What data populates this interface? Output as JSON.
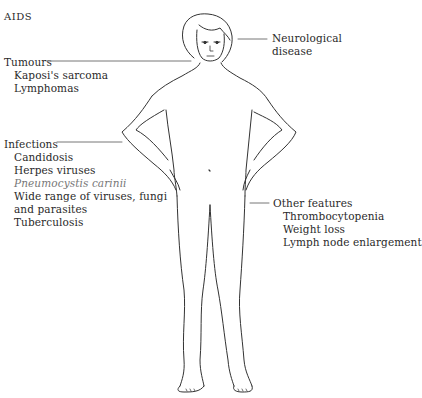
{
  "title": "AIDS",
  "groups": {
    "tumours": {
      "heading": "Tumours",
      "items": [
        "Kaposi's sarcoma",
        "Lymphomas"
      ]
    },
    "neurological": {
      "lines": [
        "Neurological",
        "disease"
      ]
    },
    "infections": {
      "heading": "Infections",
      "items": [
        "Candidosis",
        "Herpes viruses",
        "Pneumocystis carinii",
        "Wide range of viruses, fungi",
        "and parasites",
        "Tuberculosis"
      ]
    },
    "other": {
      "heading": "Other features",
      "items": [
        "Thrombocytopenia",
        "Weight loss",
        "Lymph node enlargement"
      ]
    }
  },
  "figure": {
    "stroke": "#333333"
  }
}
